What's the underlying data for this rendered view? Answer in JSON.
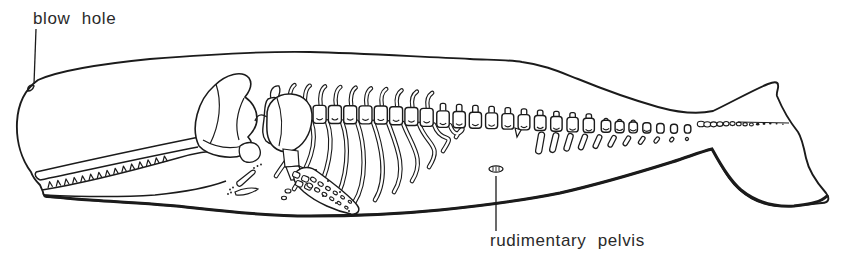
{
  "figure": {
    "labels": {
      "blow_hole": "blow hole",
      "rudimentary_pelvis": "rudimentary pelvis"
    },
    "colors": {
      "ink": "#1b1b1b",
      "background": "#ffffff",
      "label_text": "#2a2a2a"
    }
  }
}
